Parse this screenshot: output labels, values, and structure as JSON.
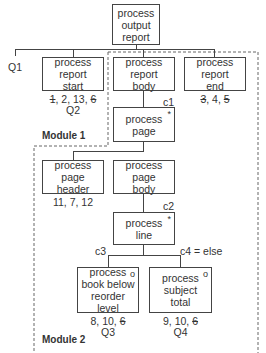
{
  "diagram": {
    "root": {
      "label": "process\noutput\nreport"
    },
    "report_start": {
      "label": "process\nreport\nstart",
      "ops": [
        "1",
        "2",
        "13",
        "6"
      ],
      "ops_struck": [
        true,
        false,
        false,
        true
      ],
      "question": "Q2"
    },
    "report_body": {
      "label": "process\nreport\nbody"
    },
    "report_end": {
      "label": "process\nreport\nend",
      "ops": [
        "3",
        "4",
        "5"
      ],
      "ops_struck": [
        true,
        false,
        true
      ]
    },
    "page": {
      "label": "process\npage",
      "marker": "*",
      "condition": "c1"
    },
    "page_header": {
      "label": "process\npage\nheader",
      "ops_text": "11, 7, 12"
    },
    "page_body": {
      "label": "process\npage\nbody"
    },
    "line": {
      "label": "process\nline",
      "marker": "*",
      "condition": "c2"
    },
    "book_below": {
      "label": "process\nbook below\nreorder\nlevel",
      "marker": "o",
      "condition": "c3",
      "ops": [
        "8",
        "10",
        "6"
      ],
      "ops_struck": [
        false,
        false,
        true
      ],
      "question": "Q3"
    },
    "subject_total": {
      "label": "process\nsubject\ntotal",
      "marker": "o",
      "condition": "c4 = else",
      "ops": [
        "9",
        "10",
        "6"
      ],
      "ops_struck": [
        false,
        false,
        true
      ],
      "question": "Q4"
    },
    "q1": "Q1",
    "module1": "Module 1",
    "module2": "Module 2"
  },
  "colors": {
    "line": "#444444",
    "dash": "#666666",
    "text": "#333333"
  }
}
